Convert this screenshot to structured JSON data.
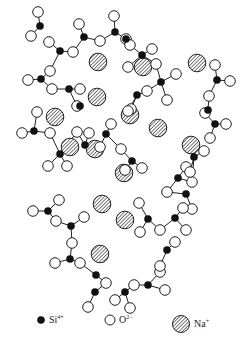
{
  "figure": {
    "type": "glass network structure (sodium silicate)",
    "atoms": {
      "si": [
        [
          62,
          13
        ],
        [
          84,
          37
        ],
        [
          57,
          62
        ],
        [
          42,
          79
        ],
        [
          69,
          90
        ],
        [
          114,
          31
        ],
        [
          142,
          55
        ],
        [
          161,
          82
        ],
        [
          96,
          165
        ],
        [
          132,
          145
        ],
        [
          178,
          178
        ],
        [
          163,
          97
        ],
        [
          185,
          170
        ],
        [
          218,
          135
        ],
        [
          215,
          83
        ],
        [
          190,
          233
        ],
        [
          162,
          252
        ],
        [
          85,
          207
        ],
        [
          62,
          221
        ],
        [
          70,
          261
        ],
        [
          96,
          276
        ],
        [
          140,
          261
        ],
        [
          65,
          60
        ],
        [
          143,
          8
        ]
      ],
      "si_pos": [],
      "note": "Si4+ black, O2- white, Na+ hatched"
    },
    "na_positions": [
      [
        98,
        62
      ],
      [
        97,
        97
      ],
      [
        55,
        117
      ],
      [
        143,
        67
      ],
      [
        197,
        63
      ],
      [
        95,
        149
      ],
      [
        158,
        128
      ],
      [
        130,
        115
      ],
      [
        191,
        145
      ],
      [
        124,
        173
      ],
      [
        70,
        147
      ],
      [
        102,
        204
      ],
      [
        125,
        220
      ],
      [
        100,
        254
      ]
    ],
    "legend": [
      {
        "symbol": "si",
        "label": "Si",
        "charge": "4+"
      },
      {
        "symbol": "o",
        "label": "O",
        "charge": "2−"
      },
      {
        "symbol": "na",
        "label": "Na",
        "charge": "+"
      }
    ]
  }
}
